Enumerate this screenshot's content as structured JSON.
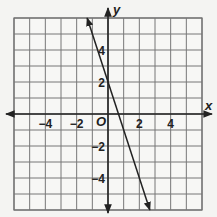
{
  "chart_data": {
    "type": "line",
    "title": "",
    "xlabel": "x",
    "ylabel": "y",
    "xlim": [
      -6,
      6
    ],
    "ylim": [
      -6,
      6
    ],
    "grid": true,
    "grid_step": 1,
    "origin_label": "O",
    "x_ticks": [
      {
        "value": -4,
        "label": "−4"
      },
      {
        "value": -2,
        "label": "−2"
      },
      {
        "value": 2,
        "label": "2"
      },
      {
        "value": 4,
        "label": "4"
      }
    ],
    "y_ticks": [
      {
        "value": 4,
        "label": "4"
      },
      {
        "value": 2,
        "label": "2"
      },
      {
        "value": -2,
        "label": "−2"
      },
      {
        "value": -4,
        "label": "−4"
      }
    ],
    "series": [
      {
        "name": "line",
        "equation": "y = -3x + 2",
        "slope": -3,
        "intercept": 2,
        "x": [
          -1.33,
          2.67
        ],
        "y": [
          6,
          -6
        ],
        "arrows_both_ends": true,
        "color": "#222222"
      }
    ]
  },
  "labels": {
    "x_axis": "x",
    "y_axis": "y",
    "origin": "O"
  }
}
